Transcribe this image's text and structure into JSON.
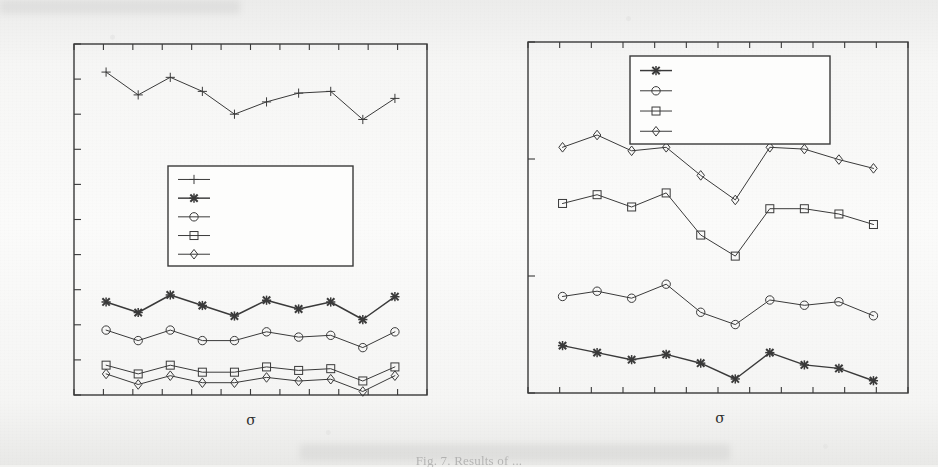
{
  "figure": {
    "caption": "Fig. 7. Results of ...",
    "background_color": "#f6f6f5",
    "ink_color": "#3a3a3a"
  },
  "chart_data": [
    {
      "type": "line",
      "panel": "left",
      "title": "",
      "xlabel": "σ",
      "ylabel": "",
      "grid": false,
      "legend_position": "center",
      "legend_entries": [
        "",
        "",
        "",
        "",
        ""
      ],
      "legend_markers": [
        "plus",
        "cross",
        "circle",
        "square",
        "diamond"
      ],
      "x_tick_count": 13,
      "y_tick_count": 11,
      "x_tick_labels": [],
      "y_tick_labels": [],
      "xlim": [
        0,
        11
      ],
      "ylim": [
        0,
        100
      ],
      "x": [
        1,
        2,
        3,
        4,
        5,
        6,
        7,
        8,
        9,
        10
      ],
      "series": [
        {
          "name": "series-plus",
          "marker": "plus",
          "values": [
            92.0,
            85.5,
            90.5,
            86.5,
            80.0,
            83.5,
            86.0,
            86.5,
            78.5,
            84.5
          ]
        },
        {
          "name": "series-cross",
          "marker": "cross",
          "values": [
            26.5,
            23.5,
            28.5,
            25.5,
            22.5,
            27.0,
            24.5,
            26.5,
            21.5,
            28.0
          ]
        },
        {
          "name": "series-circle",
          "marker": "circle",
          "values": [
            18.5,
            15.5,
            18.5,
            15.5,
            15.5,
            18.0,
            16.5,
            17.0,
            13.5,
            18.0
          ]
        },
        {
          "name": "series-square",
          "marker": "square",
          "values": [
            8.5,
            6.0,
            8.5,
            6.5,
            6.5,
            8.0,
            7.0,
            7.5,
            4.0,
            8.0
          ]
        },
        {
          "name": "series-diamond",
          "marker": "diamond",
          "values": [
            6.0,
            3.0,
            5.5,
            3.5,
            3.5,
            5.0,
            4.0,
            4.5,
            1.0,
            5.5
          ]
        }
      ]
    },
    {
      "type": "line",
      "panel": "right",
      "title": "",
      "xlabel": "σ",
      "ylabel": "",
      "grid": false,
      "legend_position": "upper center",
      "legend_entries": [
        "",
        "",
        "",
        ""
      ],
      "legend_markers": [
        "cross",
        "circle",
        "square",
        "diamond"
      ],
      "x_tick_count": 13,
      "y_tick_count": 4,
      "x_tick_labels": [],
      "y_tick_labels": [],
      "xlim": [
        0,
        11
      ],
      "ylim": [
        0,
        100
      ],
      "x": [
        1,
        2,
        3,
        4,
        5,
        6,
        7,
        8,
        9,
        10
      ],
      "series": [
        {
          "name": "series-diamond",
          "marker": "diamond",
          "values": [
            70.0,
            73.5,
            69.0,
            70.0,
            62.0,
            55.0,
            70.0,
            69.5,
            66.5,
            64.0
          ]
        },
        {
          "name": "series-square",
          "marker": "square",
          "values": [
            54.0,
            56.5,
            53.0,
            57.0,
            45.0,
            39.0,
            52.5,
            52.5,
            51.0,
            48.0
          ]
        },
        {
          "name": "series-circle",
          "marker": "circle",
          "values": [
            27.5,
            29.0,
            27.0,
            31.0,
            23.0,
            19.5,
            26.5,
            25.0,
            26.0,
            22.0
          ]
        },
        {
          "name": "series-cross",
          "marker": "cross",
          "values": [
            13.5,
            11.5,
            9.5,
            11.0,
            8.5,
            4.0,
            11.5,
            8.0,
            7.0,
            3.5
          ]
        }
      ]
    }
  ]
}
